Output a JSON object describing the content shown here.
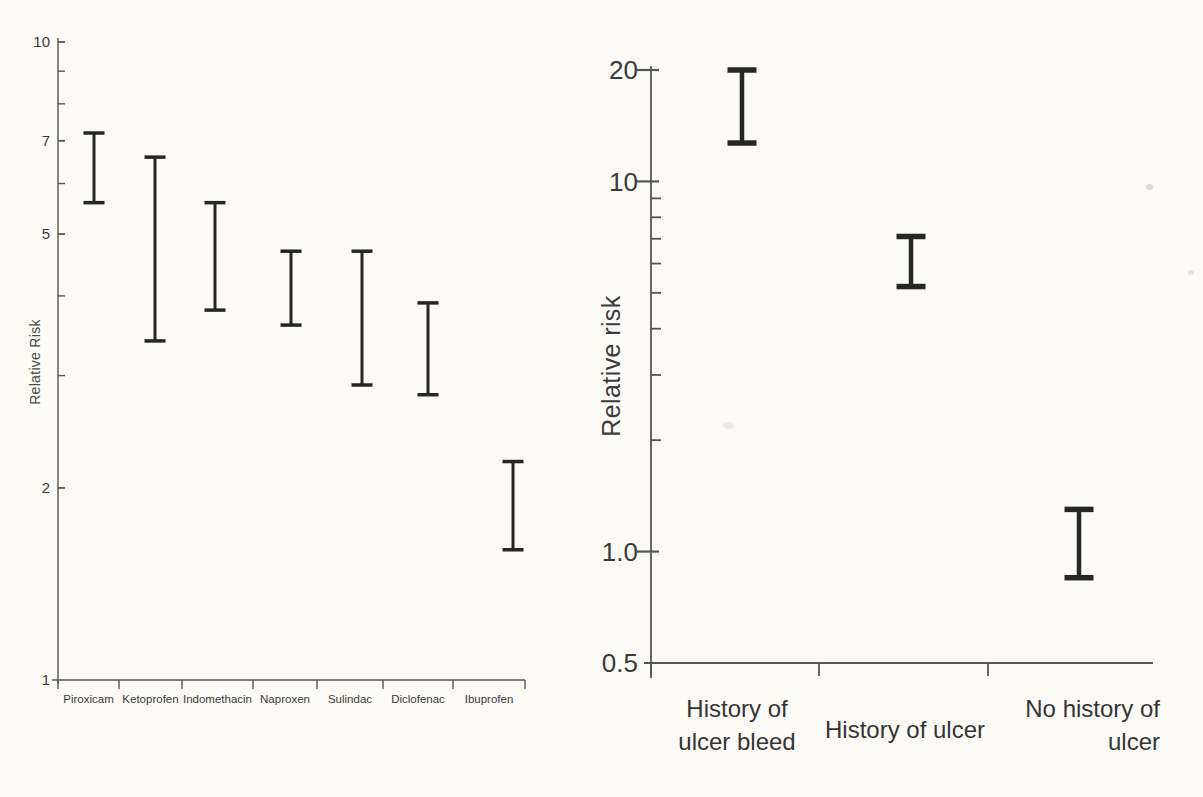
{
  "figure": {
    "background": "#fbfaf7",
    "bar_color": "#262626",
    "axis_color": "#555555",
    "text_color": "#3a3a3a"
  },
  "chart_data": [
    {
      "id": "nsaid-relative-risk",
      "type": "errorbar",
      "title": "",
      "xlabel": "",
      "ylabel": "Relative Risk",
      "scale": "log",
      "ylim": [
        1,
        10
      ],
      "grid": false,
      "legend": null,
      "yticks_labeled": [
        {
          "v": 10,
          "label": "10"
        },
        {
          "v": 7,
          "label": "7"
        },
        {
          "v": 5,
          "label": "5"
        },
        {
          "v": 2,
          "label": "2"
        },
        {
          "v": 1,
          "label": "1"
        }
      ],
      "yticks_minor": [
        9,
        8,
        6,
        4,
        3
      ],
      "categories": [
        "Piroxicam",
        "Ketoprofen",
        "Indomethacin",
        "Naproxen",
        "Sulindac",
        "Diclofenac",
        "Ibuprofen"
      ],
      "series": [
        {
          "name": "relative-risk-95ci",
          "ranges": [
            [
              5.6,
              7.2
            ],
            [
              3.4,
              6.6
            ],
            [
              3.8,
              5.6
            ],
            [
              3.6,
              4.7
            ],
            [
              2.9,
              4.7
            ],
            [
              2.8,
              3.9
            ],
            [
              1.6,
              2.2
            ]
          ]
        }
      ]
    },
    {
      "id": "ulcer-history-relative-risk",
      "type": "errorbar",
      "title": "",
      "xlabel": "",
      "ylabel": "Relative risk",
      "scale": "log",
      "ylim": [
        0.5,
        20
      ],
      "grid": false,
      "legend": null,
      "yticks_labeled": [
        {
          "v": 20,
          "label": "20"
        },
        {
          "v": 10,
          "label": "10"
        },
        {
          "v": 1,
          "label": "1.0"
        },
        {
          "v": 0.5,
          "label": "0.5"
        }
      ],
      "yticks_minor": [
        9,
        8,
        7,
        6,
        5,
        4,
        3,
        2
      ],
      "categories": [
        [
          "History of",
          "ulcer bleed"
        ],
        [
          "History of ulcer"
        ],
        [
          "No history of",
          "ulcer"
        ]
      ],
      "series": [
        {
          "name": "relative-risk-95ci",
          "ranges": [
            [
              12.7,
              20
            ],
            [
              5.2,
              7.1
            ],
            [
              0.85,
              1.3
            ]
          ]
        }
      ]
    }
  ]
}
